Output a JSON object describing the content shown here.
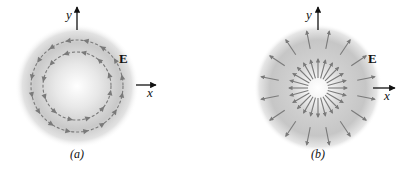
{
  "figure": {
    "panels": [
      {
        "id": "a",
        "caption": "(a)",
        "type": "circulating-field",
        "field_label": "E",
        "x_axis_label": "x",
        "y_axis_label": "y",
        "center": [
          77,
          86
        ],
        "glow_radius": 62,
        "circles": [
          {
            "radius": 46,
            "arrow_count": 16,
            "direction": "counterclockwise"
          },
          {
            "radius": 34,
            "arrow_count": 12,
            "direction": "counterclockwise"
          }
        ]
      },
      {
        "id": "b",
        "caption": "(b)",
        "type": "radial-field",
        "field_label": "E",
        "x_axis_label": "x",
        "y_axis_label": "y",
        "center": [
          318,
          88
        ],
        "glow_radius": 64,
        "rings": [
          {
            "r_start": 10,
            "r_end": 29,
            "arrow_count": 24,
            "direction": "outward"
          },
          {
            "r_start": 40,
            "r_end": 58,
            "arrow_count": 16,
            "direction": "outward"
          }
        ]
      }
    ],
    "colors": {
      "field_line": "#7a7a7a",
      "axis": "#111111",
      "glow_center": "#ffffff",
      "glow_mid": "#c8c8c8",
      "background": "#ffffff",
      "text": "#111111"
    }
  }
}
